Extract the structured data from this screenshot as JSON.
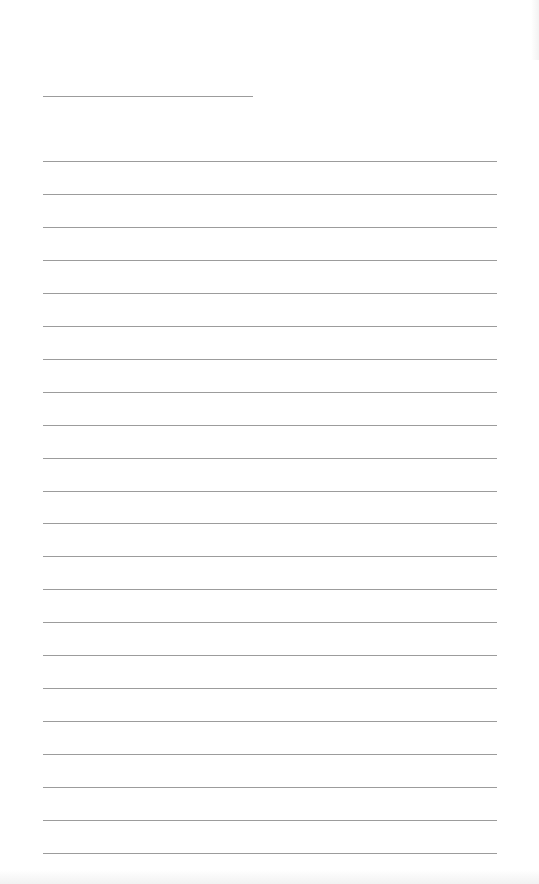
{
  "document": {
    "type": "lined-notebook-page",
    "background_color": "#ffffff",
    "line_color": "#9c9c9c",
    "title_line": {
      "x": 43,
      "y": 96,
      "width": 210
    },
    "ruled_lines": {
      "count": 22,
      "x": 43,
      "width": 454,
      "first_y": 161,
      "spacing": 32.95
    },
    "text_content": []
  }
}
